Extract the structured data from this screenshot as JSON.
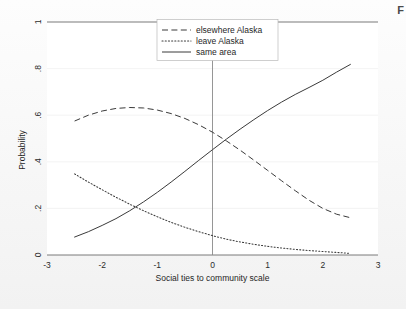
{
  "figure": {
    "corner_mark": "F",
    "background_color": "#fafafa",
    "plot_background": "#ffffff"
  },
  "chart_data": {
    "type": "line",
    "title": "",
    "xlabel": "Social ties to community scale",
    "ylabel": "Probability",
    "xlim": [
      -3,
      3
    ],
    "ylim": [
      0,
      1
    ],
    "xticks": [
      -3,
      -2,
      -1,
      0,
      1,
      2,
      3
    ],
    "xtick_labels": [
      "-3",
      "-2",
      "-1",
      "0",
      "1",
      "2",
      "3"
    ],
    "yticks": [
      0,
      0.2,
      0.4,
      0.6,
      0.8,
      1
    ],
    "ytick_labels": [
      "0",
      ".2",
      ".4",
      ".6",
      ".8",
      "1"
    ],
    "grid": "horizontal-faint",
    "legend_position": "top-center",
    "reference_line_x": 0,
    "x": [
      -2.5,
      -2.25,
      -2.0,
      -1.75,
      -1.5,
      -1.25,
      -1.0,
      -0.75,
      -0.5,
      -0.25,
      0.0,
      0.25,
      0.5,
      0.75,
      1.0,
      1.25,
      1.5,
      1.75,
      2.0,
      2.25,
      2.5
    ],
    "series": [
      {
        "name": "elsewhere Alaska",
        "style": "dashed",
        "color": "#3a3a3a",
        "values": [
          0.575,
          0.6,
          0.618,
          0.629,
          0.633,
          0.631,
          0.622,
          0.607,
          0.586,
          0.559,
          0.527,
          0.49,
          0.45,
          0.407,
          0.363,
          0.319,
          0.276,
          0.235,
          0.2,
          0.175,
          0.16
        ]
      },
      {
        "name": "leave Alaska",
        "style": "dotted",
        "color": "#3a3a3a",
        "values": [
          0.348,
          0.313,
          0.28,
          0.248,
          0.218,
          0.19,
          0.164,
          0.14,
          0.119,
          0.1,
          0.083,
          0.068,
          0.056,
          0.046,
          0.037,
          0.03,
          0.024,
          0.019,
          0.015,
          0.011,
          0.007
        ]
      },
      {
        "name": "same area",
        "style": "solid",
        "color": "#3a3a3a",
        "values": [
          0.077,
          0.1,
          0.127,
          0.156,
          0.19,
          0.228,
          0.269,
          0.313,
          0.359,
          0.406,
          0.452,
          0.497,
          0.54,
          0.581,
          0.62,
          0.656,
          0.689,
          0.719,
          0.75,
          0.785,
          0.818
        ]
      }
    ],
    "legend_entries": [
      {
        "label": "elsewhere Alaska",
        "style": "dashed"
      },
      {
        "label": "leave Alaska",
        "style": "dotted"
      },
      {
        "label": "same area",
        "style": "solid"
      }
    ]
  }
}
